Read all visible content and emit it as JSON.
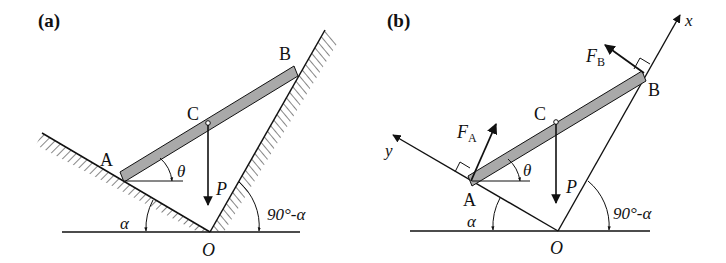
{
  "panels": [
    {
      "id": "a",
      "label": "(a)",
      "points": {
        "A": "A",
        "B": "B",
        "C": "C",
        "O": "O"
      },
      "force_P": "P",
      "angles": {
        "theta": "θ",
        "alpha": "α",
        "complement": "90°-α"
      }
    },
    {
      "id": "b",
      "label": "(b)",
      "points": {
        "A": "A",
        "B": "B",
        "C": "C",
        "O": "O"
      },
      "force_P": "P",
      "force_FA": {
        "main": "F",
        "sub": "A"
      },
      "force_FB": {
        "main": "F",
        "sub": "B"
      },
      "axes": {
        "x": "x",
        "y": "y"
      },
      "angles": {
        "theta": "θ",
        "alpha": "α",
        "complement": "90°-α"
      }
    }
  ],
  "colors": {
    "line": "#111111",
    "bar_fill": "#a9a9a9",
    "hatch": "#333333"
  }
}
